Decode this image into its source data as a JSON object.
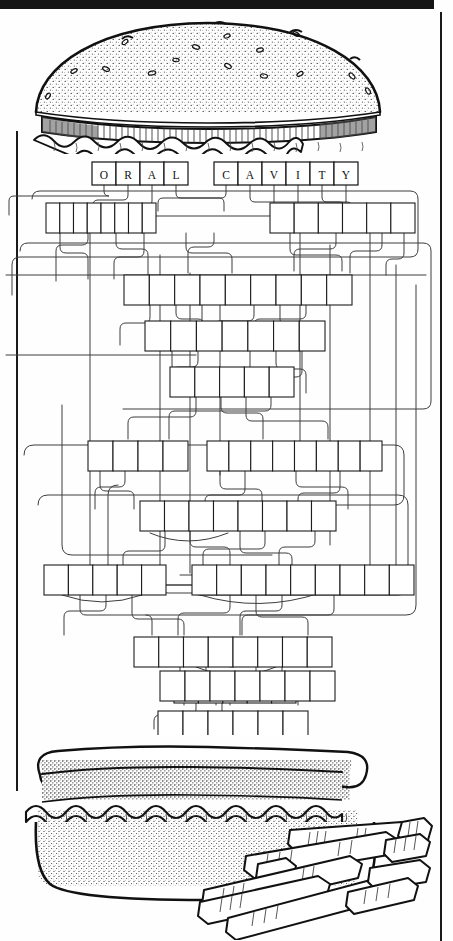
{
  "page": {
    "kind": "scanned-puzzle-worksheet",
    "background_color": "#fefefe",
    "ink_color": "#1a1a1a",
    "scan_artifact_color": "#151515"
  },
  "title_row": {
    "name": "oral-cavity-answer-row",
    "groups": [
      {
        "word": "ORAL",
        "letters": [
          "O",
          "R",
          "A",
          "L"
        ]
      },
      {
        "word": "CAVITY",
        "letters": [
          "C",
          "A",
          "V",
          "I",
          "T",
          "Y"
        ]
      }
    ]
  },
  "illustrations": [
    {
      "name": "burger-top-bun",
      "label": "sesame seed hamburger top bun with lettuce",
      "position": "top"
    },
    {
      "name": "burger-bottom-bun",
      "label": "hamburger bottom bun with patty and lettuce",
      "position": "bottom"
    },
    {
      "name": "french-fries",
      "label": "pile of french fries",
      "position": "bottom-right"
    }
  ],
  "puzzle": {
    "name": "connected-letter-box-maze",
    "description": "rows of blank letter boxes joined by routed connector lines",
    "rows": [
      {
        "row": 1,
        "groups": [
          {
            "boxes": 8,
            "x": 46,
            "w": 110
          },
          {
            "boxes": 6,
            "x": 270,
            "w": 145
          }
        ]
      },
      {
        "row": 2,
        "groups": [
          {
            "boxes": 9,
            "x": 124,
            "w": 228
          }
        ]
      },
      {
        "row": 3,
        "groups": [
          {
            "boxes": 7,
            "x": 145,
            "w": 180
          }
        ]
      },
      {
        "row": 4,
        "groups": [
          {
            "boxes": 5,
            "x": 170,
            "w": 124
          }
        ]
      },
      {
        "row": 5,
        "groups": [
          {
            "boxes": 4,
            "x": 88,
            "w": 100
          },
          {
            "boxes": 8,
            "x": 207,
            "w": 175
          }
        ]
      },
      {
        "row": 6,
        "groups": [
          {
            "boxes": 8,
            "x": 140,
            "w": 196
          }
        ]
      },
      {
        "row": 7,
        "groups": [
          {
            "boxes": 5,
            "x": 44,
            "w": 122
          },
          {
            "boxes": 9,
            "x": 192,
            "w": 222
          }
        ]
      },
      {
        "row": 8,
        "groups": [
          {
            "boxes": 8,
            "x": 134,
            "w": 198
          }
        ]
      },
      {
        "row": 9,
        "groups": [
          {
            "boxes": 5,
            "x": 174,
            "w": 122
          }
        ]
      },
      {
        "row": 10,
        "groups": [
          {
            "boxes": 7,
            "x": 160,
            "w": 175
          }
        ]
      },
      {
        "row": 11,
        "groups": [
          {
            "boxes": 6,
            "x": 158,
            "w": 150
          }
        ]
      }
    ]
  }
}
